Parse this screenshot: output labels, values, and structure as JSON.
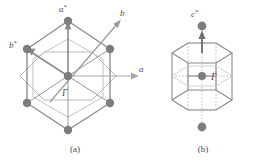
{
  "figure": {
    "background_color": "#ffffff",
    "ink_color": "#6e6e6e",
    "dot_color": "#7d7d7d",
    "faint_color": "#b5b5b5"
  },
  "panel_a": {
    "caption": "(a)",
    "labels": {
      "a_star": "a",
      "a_star_sup": "*",
      "b_star": "b",
      "b_star_sup": "*",
      "b": "b",
      "a": "a",
      "gamma": "Γ"
    },
    "description": "Plan view of hexagonal reciprocal net with outer hexagon of reciprocal lattice points, inner Brillouin-zone hexagon and basis vectors",
    "lattice_points": 7,
    "arrows": [
      "a*",
      "b*",
      "b",
      "a"
    ]
  },
  "panel_b": {
    "caption": "(b)",
    "labels": {
      "c_star": "c",
      "c_star_sup": "*",
      "gamma": "Γ"
    },
    "description": "Perspective view of hexagonal prism Brillouin zone with c* axis through the centre",
    "lattice_points": 2,
    "arrows": [
      "c*"
    ]
  }
}
